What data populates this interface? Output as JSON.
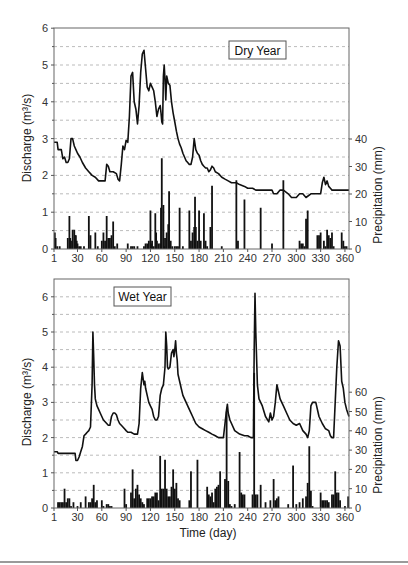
{
  "figure": {
    "x_axis_label": "Time (day)",
    "left_axis_label": "Discharge (m³/s)",
    "right_axis_label": "Precipitation (mm)",
    "x_ticks": [
      1,
      30,
      60,
      90,
      120,
      150,
      180,
      210,
      240,
      270,
      300,
      330,
      360
    ]
  },
  "chart_data": [
    {
      "type": "line+bar",
      "title": "Dry Year",
      "legend_label": "Dry Year",
      "xlabel": "",
      "ylabel_left": "Discharge (m3/s)",
      "ylabel_right": "Precipitation (mm)",
      "xlim": [
        1,
        365
      ],
      "ylim_left": [
        0,
        6
      ],
      "ylim_right": [
        0,
        80
      ],
      "left_ticks": [
        0,
        1,
        2,
        3,
        4,
        5,
        6
      ],
      "right_ticks": [
        0,
        10,
        20,
        30,
        40
      ],
      "grid": "dashed horizontal every 0.5",
      "discharge": {
        "x": [
          1,
          5,
          6,
          10,
          12,
          14,
          16,
          18,
          20,
          22,
          24,
          26,
          28,
          30,
          33,
          36,
          40,
          44,
          48,
          52,
          56,
          60,
          64,
          66,
          68,
          70,
          74,
          78,
          80,
          82,
          84,
          86,
          88,
          90,
          92,
          94,
          96,
          98,
          100,
          102,
          104,
          106,
          108,
          110,
          112,
          114,
          116,
          118,
          120,
          122,
          124,
          126,
          128,
          130,
          132,
          133,
          134,
          135,
          136,
          137,
          138,
          139,
          140,
          142,
          144,
          146,
          148,
          150,
          152,
          154,
          156,
          158,
          160,
          162,
          164,
          166,
          168,
          170,
          172,
          174,
          176,
          178,
          180,
          182,
          184,
          186,
          188,
          190,
          192,
          194,
          196,
          198,
          200,
          204,
          208,
          212,
          216,
          220,
          226,
          230,
          236,
          240,
          246,
          250,
          260,
          270,
          272,
          276,
          280,
          284,
          290,
          294,
          300,
          304,
          308,
          312,
          318,
          326,
          330,
          332,
          334,
          336,
          338,
          340,
          342,
          344,
          348,
          356,
          365
        ],
        "y": [
          2.9,
          2.9,
          2.7,
          2.7,
          2.45,
          2.5,
          2.35,
          2.35,
          2.45,
          3.0,
          3.0,
          2.8,
          2.7,
          2.6,
          2.5,
          2.35,
          2.2,
          2.1,
          2.0,
          1.95,
          1.85,
          1.85,
          1.85,
          2.3,
          2.25,
          2.1,
          2.1,
          2.05,
          1.9,
          1.85,
          2.3,
          2.8,
          2.7,
          2.95,
          2.9,
          3.6,
          4.7,
          4.8,
          4.0,
          3.8,
          3.4,
          3.9,
          4.8,
          5.3,
          5.4,
          4.9,
          4.4,
          4.3,
          4.5,
          4.4,
          4.3,
          4.0,
          3.6,
          3.8,
          3.9,
          3.7,
          3.45,
          3.4,
          4.7,
          5.0,
          4.6,
          4.05,
          4.7,
          4.5,
          4.45,
          4.0,
          3.7,
          3.45,
          3.2,
          3.0,
          2.85,
          2.75,
          2.6,
          2.5,
          2.4,
          2.35,
          2.3,
          2.3,
          2.5,
          3.0,
          2.7,
          2.6,
          2.55,
          2.4,
          2.3,
          2.25,
          2.2,
          2.2,
          2.1,
          2.15,
          2.25,
          2.2,
          2.1,
          2.05,
          1.95,
          1.9,
          1.85,
          1.8,
          1.8,
          1.75,
          1.7,
          1.65,
          1.65,
          1.6,
          1.6,
          1.6,
          1.5,
          1.5,
          1.6,
          1.6,
          1.5,
          1.4,
          1.4,
          1.5,
          1.5,
          1.4,
          1.5,
          1.5,
          1.5,
          1.8,
          1.95,
          1.75,
          1.85,
          1.7,
          1.65,
          1.6,
          1.6,
          1.6,
          1.6
        ]
      },
      "precipitation": {
        "x": [
          2,
          3,
          5,
          8,
          18,
          20,
          21,
          22,
          24,
          26,
          27,
          28,
          29,
          30,
          32,
          34,
          38,
          44,
          46,
          52,
          55,
          60,
          62,
          64,
          66,
          68,
          70,
          72,
          74,
          76,
          79,
          92,
          96,
          98,
          100,
          104,
          112,
          114,
          116,
          118,
          120,
          121,
          122,
          124,
          126,
          127,
          128,
          130,
          132,
          133,
          134,
          136,
          137,
          138,
          140,
          142,
          143,
          145,
          147,
          150,
          152,
          154,
          156,
          160,
          168,
          170,
          172,
          174,
          175,
          176,
          178,
          180,
          182,
          186,
          188,
          190,
          194,
          196,
          208,
          226,
          228,
          236,
          256,
          270,
          284,
          304,
          306,
          308,
          310,
          312,
          314,
          326,
          328,
          330,
          334,
          336,
          338,
          340,
          342,
          344,
          346,
          356,
          358,
          360,
          362
        ],
        "y": [
          6,
          4,
          1,
          1,
          4,
          12,
          4,
          3,
          7,
          7,
          5,
          5,
          3,
          2,
          1,
          1,
          1,
          12,
          5,
          6,
          1,
          3,
          6,
          3,
          12,
          4,
          4,
          5,
          10,
          1,
          2,
          2,
          1,
          1,
          1,
          1,
          1,
          2,
          2,
          3,
          14,
          2,
          3,
          1,
          13,
          6,
          3,
          2,
          2,
          15,
          33,
          16,
          1,
          4,
          6,
          9,
          21,
          3,
          1,
          1,
          1,
          1,
          15,
          1,
          14,
          3,
          6,
          8,
          19,
          8,
          3,
          14,
          3,
          13,
          3,
          1,
          8,
          23,
          1,
          25,
          3,
          18,
          15,
          2,
          25,
          3,
          2,
          2,
          1,
          11,
          14,
          5,
          5,
          6,
          3,
          1,
          7,
          5,
          4,
          6,
          1,
          6,
          3,
          1,
          1
        ]
      }
    },
    {
      "type": "line+bar",
      "title": "Wet Year",
      "legend_label": "Wet Year",
      "xlabel": "Time (day)",
      "ylabel_left": "Discharge (m3/s)",
      "ylabel_right": "Precipitation (mm)",
      "xlim": [
        1,
        365
      ],
      "ylim_left": [
        0,
        6.5
      ],
      "ylim_right": [
        0,
        120
      ],
      "left_ticks": [
        0,
        1,
        2,
        3,
        4,
        5,
        6
      ],
      "right_ticks": [
        0,
        10,
        20,
        30,
        40,
        50,
        60
      ],
      "grid": "dashed horizontal every 0.5",
      "discharge": {
        "x": [
          1,
          5,
          6,
          27,
          28,
          30,
          32,
          34,
          36,
          38,
          40,
          42,
          44,
          46,
          48,
          49,
          50,
          51,
          52,
          53,
          54,
          56,
          58,
          60,
          62,
          64,
          66,
          68,
          70,
          72,
          74,
          76,
          78,
          80,
          82,
          84,
          86,
          88,
          90,
          92,
          96,
          100,
          104,
          106,
          108,
          110,
          112,
          113,
          114,
          116,
          118,
          120,
          122,
          124,
          126,
          128,
          130,
          132,
          134,
          136,
          138,
          139,
          140,
          141,
          142,
          144,
          146,
          148,
          149,
          150,
          151,
          152,
          153,
          154,
          156,
          158,
          160,
          164,
          168,
          172,
          176,
          180,
          184,
          188,
          192,
          196,
          200,
          204,
          210,
          212,
          214,
          215,
          216,
          218,
          220,
          224,
          230,
          236,
          240,
          244,
          246,
          247,
          248,
          249,
          250,
          252,
          254,
          258,
          262,
          266,
          268,
          270,
          272,
          274,
          276,
          278,
          280,
          284,
          288,
          292,
          296,
          300,
          304,
          308,
          312,
          314,
          316,
          318,
          320,
          324,
          328,
          332,
          336,
          340,
          342,
          344,
          346,
          348,
          350,
          352,
          354,
          356,
          358,
          360,
          362,
          365
        ],
        "y": [
          1.6,
          1.6,
          1.55,
          1.55,
          1.35,
          1.35,
          1.45,
          1.6,
          1.75,
          2.05,
          2.1,
          2.15,
          2.2,
          2.3,
          3.5,
          5.0,
          4.3,
          3.5,
          3.1,
          3.0,
          2.9,
          2.8,
          2.7,
          2.6,
          2.5,
          2.45,
          2.4,
          2.35,
          2.35,
          2.6,
          2.7,
          2.7,
          2.65,
          2.5,
          2.4,
          2.35,
          2.3,
          2.25,
          2.2,
          2.15,
          2.15,
          2.1,
          2.1,
          2.4,
          3.4,
          3.85,
          3.5,
          3.6,
          3.4,
          3.2,
          3.0,
          2.9,
          2.8,
          2.6,
          2.5,
          2.5,
          2.6,
          3.2,
          3.4,
          3.5,
          4.0,
          5.0,
          4.6,
          4.0,
          3.95,
          4.0,
          4.4,
          4.5,
          4.3,
          4.5,
          4.75,
          4.4,
          4.2,
          3.8,
          3.6,
          3.4,
          3.2,
          3.0,
          2.8,
          2.6,
          2.4,
          2.3,
          2.25,
          2.2,
          2.15,
          2.1,
          2.05,
          2.0,
          2.0,
          2.4,
          2.8,
          2.95,
          2.7,
          2.5,
          2.4,
          2.2,
          2.1,
          2.05,
          2.05,
          2.0,
          2.0,
          2.0,
          4.5,
          6.1,
          5.0,
          3.5,
          3.1,
          2.9,
          2.6,
          2.45,
          2.7,
          2.5,
          2.6,
          3.0,
          3.5,
          3.3,
          3.1,
          2.9,
          2.7,
          2.5,
          2.4,
          2.35,
          2.4,
          2.2,
          2.1,
          2.0,
          2.2,
          2.9,
          3.0,
          3.0,
          2.6,
          2.4,
          2.25,
          2.2,
          2.05,
          2.0,
          2.0,
          3.0,
          4.0,
          4.75,
          4.6,
          3.6,
          3.4,
          3.0,
          2.8,
          2.6,
          2.55,
          2.5,
          2.45
        ]
      },
      "precipitation": {
        "x": [
          6,
          8,
          10,
          12,
          14,
          16,
          18,
          20,
          22,
          25,
          30,
          34,
          40,
          44,
          46,
          48,
          50,
          52,
          54,
          60,
          62,
          66,
          68,
          70,
          72,
          88,
          90,
          96,
          98,
          100,
          102,
          104,
          106,
          108,
          110,
          112,
          116,
          118,
          120,
          122,
          124,
          126,
          128,
          130,
          132,
          134,
          136,
          138,
          140,
          142,
          144,
          146,
          148,
          150,
          152,
          154,
          156,
          168,
          170,
          178,
          190,
          192,
          194,
          196,
          198,
          200,
          202,
          204,
          206,
          212,
          214,
          216,
          218,
          220,
          224,
          230,
          232,
          234,
          236,
          246,
          248,
          250,
          252,
          256,
          262,
          268,
          272,
          274,
          276,
          278,
          290,
          296,
          300,
          304,
          308,
          312,
          314,
          316,
          318,
          320,
          330,
          332,
          334,
          336,
          338,
          340,
          344,
          346,
          348,
          350,
          352,
          354,
          360,
          364
        ],
        "y": [
          3,
          3,
          3,
          3,
          10,
          3,
          5,
          5,
          1,
          3,
          1,
          3,
          6,
          3,
          3,
          5,
          12,
          3,
          4,
          4,
          1,
          2,
          2,
          1,
          1,
          10,
          2,
          8,
          20,
          5,
          10,
          12,
          7,
          5,
          3,
          2,
          5,
          5,
          5,
          6,
          6,
          8,
          8,
          4,
          27,
          10,
          10,
          25,
          10,
          6,
          6,
          11,
          20,
          10,
          13,
          5,
          4,
          4,
          19,
          25,
          11,
          7,
          6,
          8,
          3,
          10,
          11,
          12,
          19,
          15,
          50,
          14,
          2,
          1,
          2,
          29,
          8,
          7,
          7,
          7,
          70,
          7,
          7,
          12,
          3,
          4,
          15,
          4,
          5,
          6,
          2,
          22,
          2,
          3,
          5,
          6,
          13,
          32,
          9,
          1,
          8,
          4,
          4,
          4,
          4,
          3,
          7,
          7,
          19,
          8,
          8,
          4,
          1,
          6
        ]
      }
    }
  ]
}
